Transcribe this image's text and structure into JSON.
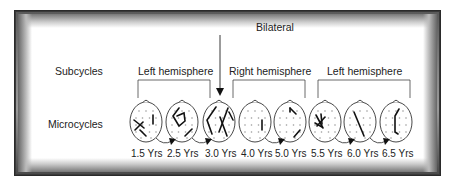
{
  "diagram": {
    "row_labels": {
      "subcycles": "Subcycles",
      "microcycles": "Microcycles"
    },
    "bilateral_label": "Bilateral",
    "subcycles": [
      {
        "label": "Left hemisphere",
        "spans_ages": [
          "1.5 Yrs",
          "2.5 Yrs",
          "3.0 Yrs"
        ]
      },
      {
        "label": "Right hemisphere",
        "spans_ages": [
          "3.0 Yrs",
          "4.0 Yrs",
          "5.0 Yrs"
        ]
      },
      {
        "label": "Left hemisphere",
        "spans_ages": [
          "5.5 Yrs",
          "6.0 Yrs",
          "6.5 Yrs"
        ]
      }
    ],
    "microcycles": [
      {
        "age": "1.5 Yrs",
        "pattern": "left-posterior-cross, right-short-line"
      },
      {
        "age": "2.5 Yrs",
        "pattern": "left-frontal-loop, right-posterior-line"
      },
      {
        "age": "3.0 Yrs",
        "pattern": "bilateral-lines"
      },
      {
        "age": "4.0 Yrs",
        "pattern": "right-short-line"
      },
      {
        "age": "5.0 Yrs",
        "pattern": "right-frontal-and-posterior-lines"
      },
      {
        "age": "5.5 Yrs",
        "pattern": "left-central-cross"
      },
      {
        "age": "6.0 Yrs",
        "pattern": "left-diagonal-line"
      },
      {
        "age": "6.5 Yrs",
        "pattern": "left-bracket-line"
      }
    ],
    "colors": {
      "ink": "#222222",
      "head_outline": "#333333",
      "electrode_dots": "#999999",
      "frame_dark": "#3a3a3a",
      "panel": "#ffffff"
    }
  }
}
